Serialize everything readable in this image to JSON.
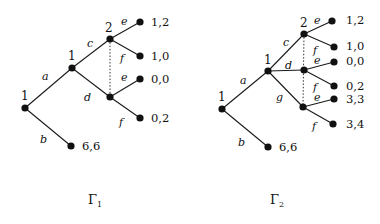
{
  "games": [
    {
      "name": "Γ1",
      "title": "Γ",
      "subscript": "1",
      "player_labels": {
        "root": "1",
        "second": "1",
        "info_set": "2"
      },
      "actions": {
        "a": "a",
        "b": "b",
        "c": "c",
        "d": "d",
        "e_top": "e",
        "f_top": "f",
        "e_bottom": "e",
        "f_bottom": "f"
      },
      "payoffs": {
        "ce": "1,2",
        "cf": "1,0",
        "de": "0,0",
        "df": "0,2",
        "b": "6,6"
      }
    },
    {
      "name": "Γ2",
      "title": "Γ",
      "subscript": "2",
      "player_labels": {
        "root": "1",
        "second": "1",
        "info_set": "2"
      },
      "actions": {
        "a": "a",
        "b": "b",
        "c": "c",
        "d": "d",
        "g": "g",
        "e_c": "e",
        "f_c": "f",
        "e_d": "e",
        "f_d": "f",
        "e_g": "e",
        "f_g": "f"
      },
      "payoffs": {
        "ce": "1,2",
        "cf": "1,0",
        "de": "0,0",
        "df": "0,2",
        "ge": "3,3",
        "gf": "3,4",
        "b": "6,6"
      }
    }
  ]
}
